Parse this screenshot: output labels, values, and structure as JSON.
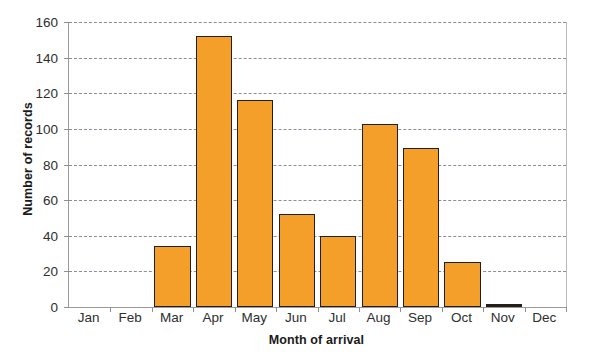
{
  "chart_data": {
    "type": "bar",
    "title": "",
    "subtitle": "",
    "xlabel": "Month of arrival",
    "ylabel": "Number of records",
    "categories": [
      "Jan",
      "Feb",
      "Mar",
      "Apr",
      "May",
      "Jun",
      "Jul",
      "Aug",
      "Sep",
      "Oct",
      "Nov",
      "Dec"
    ],
    "values": [
      0,
      0,
      34,
      152,
      116,
      52,
      40,
      103,
      89,
      25,
      1,
      0
    ],
    "series": [
      {
        "name": "Number of records",
        "values": [
          0,
          0,
          34,
          152,
          116,
          52,
          40,
          103,
          89,
          25,
          1,
          0
        ]
      }
    ],
    "ylim": [
      0,
      160
    ],
    "ytick_labels": [
      "0",
      "20",
      "40",
      "60",
      "80",
      "100",
      "120",
      "140",
      "160"
    ],
    "ytick_values": [
      0,
      20,
      40,
      60,
      80,
      100,
      120,
      140,
      160
    ],
    "grid": true,
    "grid_axis": "y",
    "grid_style": "dashed",
    "legend": false,
    "legend_position": "none",
    "bar_color": "#F59F2B",
    "bar_border_color": "#231F18",
    "gridline_color": "#8C8C9A",
    "axis_color": "#9A9A9A",
    "background_color": "#FFFFFF"
  }
}
